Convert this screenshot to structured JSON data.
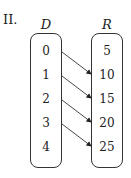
{
  "label": "II.",
  "domain": {
    "header": "D",
    "items": [
      "0",
      "1",
      "2",
      "3",
      "4"
    ]
  },
  "range": {
    "header": "R",
    "items": [
      "5",
      "10",
      "15",
      "20",
      "25"
    ]
  },
  "mappings": [
    {
      "from": "0",
      "to": "10"
    },
    {
      "from": "1",
      "to": "15"
    },
    {
      "from": "2",
      "to": "20"
    },
    {
      "from": "3",
      "to": "25"
    }
  ]
}
